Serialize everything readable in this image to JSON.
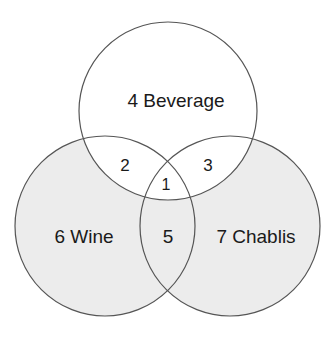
{
  "diagram": {
    "type": "venn",
    "colors": {
      "background": "#ffffff",
      "outer_fill": "#ececec",
      "top_fill": "#ffffff",
      "stroke": "#555555",
      "text": "#1a1a1a"
    },
    "sets": [
      {
        "id": "beverage",
        "label": "4 Beverage",
        "cx": 168,
        "cy": 111,
        "r": 89
      },
      {
        "id": "wine",
        "label": "6 Wine",
        "cx": 105,
        "cy": 226,
        "r": 90
      },
      {
        "id": "chablis",
        "label": "7 Chablis",
        "cx": 230,
        "cy": 226,
        "r": 90
      }
    ],
    "regions": {
      "beverage_only": "4 Beverage",
      "wine_only": "6 Wine",
      "chablis_only": "7 Chablis",
      "beverage_wine": "2",
      "beverage_chablis": "3",
      "all_three": "1",
      "wine_chablis": "5"
    }
  }
}
